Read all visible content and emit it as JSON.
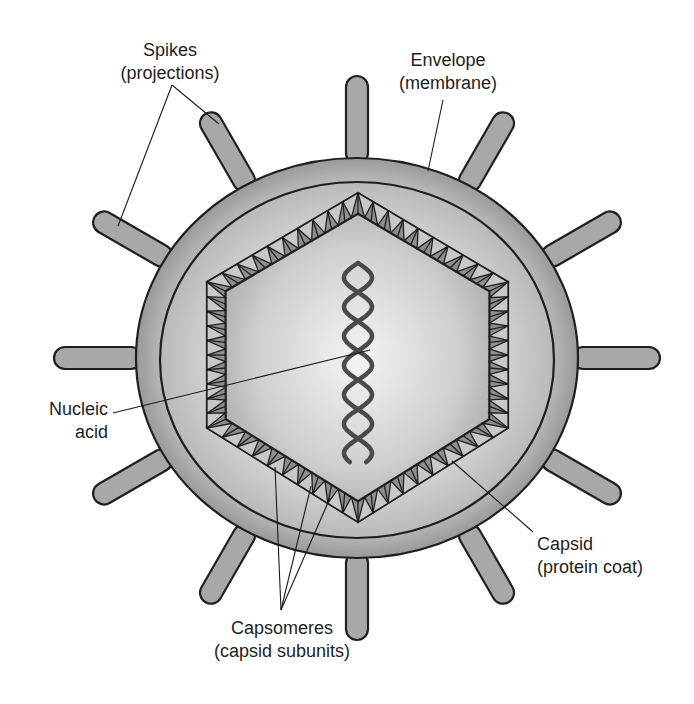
{
  "diagram": {
    "colors": {
      "envelope": "#9c9c9c",
      "membrane_fill_center": "#f2f2f2",
      "membrane_fill_edge": "#b4b4b4",
      "capsid_band_dark": "#8e8e8e",
      "capsid_band_light": "#c8c8c8",
      "spike": "#a8a8a8",
      "nucleic_acid": "#4a4a4a",
      "outline": "#1f1f1f",
      "text": "#1e1e1e"
    },
    "labels": {
      "spikes": {
        "line1": "Spikes",
        "line2": "(projections)"
      },
      "envelope": {
        "line1": "Envelope",
        "line2": "(membrane)"
      },
      "nucleic_acid": {
        "line1": "Nucleic",
        "line2": "acid"
      },
      "capsid": {
        "line1": "Capsid",
        "line2": "(protein coat)"
      },
      "capsomeres": {
        "line1": "Capsomeres",
        "line2": "(capsid subunits)"
      }
    },
    "spike_count": 12
  }
}
